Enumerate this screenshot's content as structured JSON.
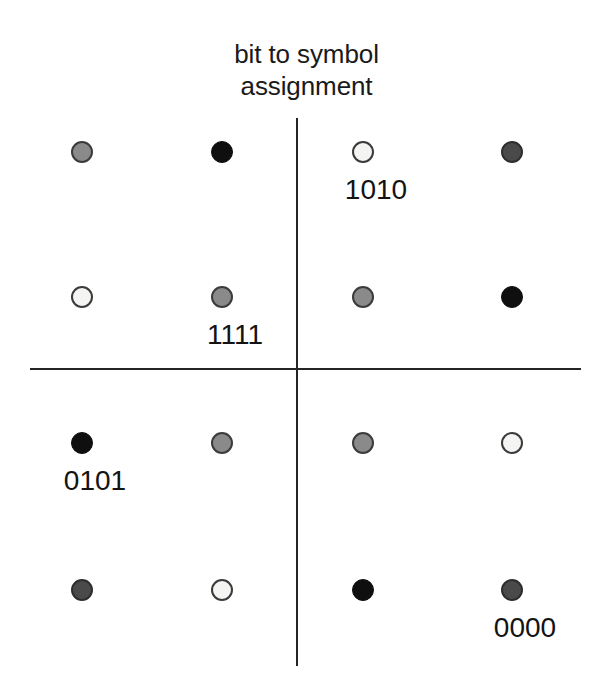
{
  "figure": {
    "title": "bit to symbol\nassignment",
    "background_color": "#ffffff",
    "width": 613,
    "height": 694
  },
  "axes": {
    "vertical": {
      "name": "quadrature-axis",
      "x": 297,
      "y_top": 118,
      "y_bottom": 666,
      "color": "#252525"
    },
    "horizontal": {
      "name": "in-phase-axis",
      "y": 369,
      "x_left": 30,
      "x_right": 581,
      "color": "#252525"
    }
  },
  "chart_data": {
    "type": "scatter",
    "title": "bit to symbol assignment",
    "subtitle": "",
    "xlabel": "",
    "ylabel": "",
    "grid": false,
    "legend": "none",
    "axis_origin": {
      "x": 297,
      "y": 369
    },
    "column_x": [
      82,
      222,
      363,
      512
    ],
    "row_y": [
      152,
      297,
      443,
      590
    ],
    "column_i": [
      -3,
      -1,
      1,
      3
    ],
    "row_q": [
      3,
      1,
      -1,
      -3
    ],
    "fill_legend": {
      "black": "#100f0f",
      "darkgray": "#4a4a4a",
      "gray": "#8a8a8a",
      "white": "#f4f4f2"
    },
    "points": [
      {
        "id": "p-r1c1",
        "x": 82,
        "y": 152,
        "i": -3,
        "q": 3,
        "fill": "gray",
        "label": ""
      },
      {
        "id": "p-r1c2",
        "x": 222,
        "y": 152,
        "i": -1,
        "q": 3,
        "fill": "black",
        "label": ""
      },
      {
        "id": "p-r1c3",
        "x": 363,
        "y": 152,
        "i": 1,
        "q": 3,
        "fill": "white",
        "label": "1010"
      },
      {
        "id": "p-r1c4",
        "x": 512,
        "y": 152,
        "i": 3,
        "q": 3,
        "fill": "darkgray",
        "label": ""
      },
      {
        "id": "p-r2c1",
        "x": 82,
        "y": 297,
        "i": -3,
        "q": 1,
        "fill": "white",
        "label": ""
      },
      {
        "id": "p-r2c2",
        "x": 222,
        "y": 297,
        "i": -1,
        "q": 1,
        "fill": "gray",
        "label": "1111"
      },
      {
        "id": "p-r2c3",
        "x": 363,
        "y": 297,
        "i": 1,
        "q": 1,
        "fill": "gray",
        "label": ""
      },
      {
        "id": "p-r2c4",
        "x": 512,
        "y": 297,
        "i": 3,
        "q": 1,
        "fill": "black",
        "label": ""
      },
      {
        "id": "p-r3c1",
        "x": 82,
        "y": 443,
        "i": -3,
        "q": -1,
        "fill": "black",
        "label": "0101"
      },
      {
        "id": "p-r3c2",
        "x": 222,
        "y": 443,
        "i": -1,
        "q": -1,
        "fill": "gray",
        "label": ""
      },
      {
        "id": "p-r3c3",
        "x": 363,
        "y": 443,
        "i": 1,
        "q": -1,
        "fill": "gray",
        "label": ""
      },
      {
        "id": "p-r3c4",
        "x": 512,
        "y": 443,
        "i": 3,
        "q": -1,
        "fill": "white",
        "label": ""
      },
      {
        "id": "p-r4c1",
        "x": 82,
        "y": 590,
        "i": -3,
        "q": -3,
        "fill": "darkgray",
        "label": ""
      },
      {
        "id": "p-r4c2",
        "x": 222,
        "y": 590,
        "i": -1,
        "q": -3,
        "fill": "white",
        "label": ""
      },
      {
        "id": "p-r4c3",
        "x": 363,
        "y": 590,
        "i": 1,
        "q": -3,
        "fill": "black",
        "label": ""
      },
      {
        "id": "p-r4c4",
        "x": 512,
        "y": 590,
        "i": 3,
        "q": -3,
        "fill": "darkgray",
        "label": "0000"
      }
    ],
    "annotations": [
      {
        "text": "1010",
        "x": 376,
        "y": 175,
        "anchor": "p-r1c3"
      },
      {
        "text": "1111",
        "x": 235,
        "y": 320,
        "anchor": "p-r2c2"
      },
      {
        "text": "0101",
        "x": 95,
        "y": 466,
        "anchor": "p-r3c1"
      },
      {
        "text": "0000",
        "x": 525,
        "y": 613,
        "anchor": "p-r4c4"
      }
    ]
  }
}
